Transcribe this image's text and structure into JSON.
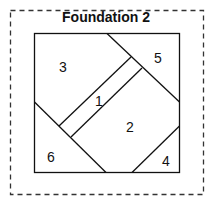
{
  "diagram": {
    "title": "Foundation 2",
    "pieces": [
      {
        "label": "1",
        "x": 99,
        "y": 101
      },
      {
        "label": "2",
        "x": 130,
        "y": 132
      },
      {
        "label": "3",
        "x": 63,
        "y": 67
      },
      {
        "label": "4",
        "x": 166,
        "y": 165
      },
      {
        "label": "5",
        "x": 158,
        "y": 58
      },
      {
        "label": "6",
        "x": 51,
        "y": 157
      }
    ],
    "colors": {
      "line": "#111111",
      "dashed_border": "#333333",
      "background": "#ffffff"
    }
  }
}
